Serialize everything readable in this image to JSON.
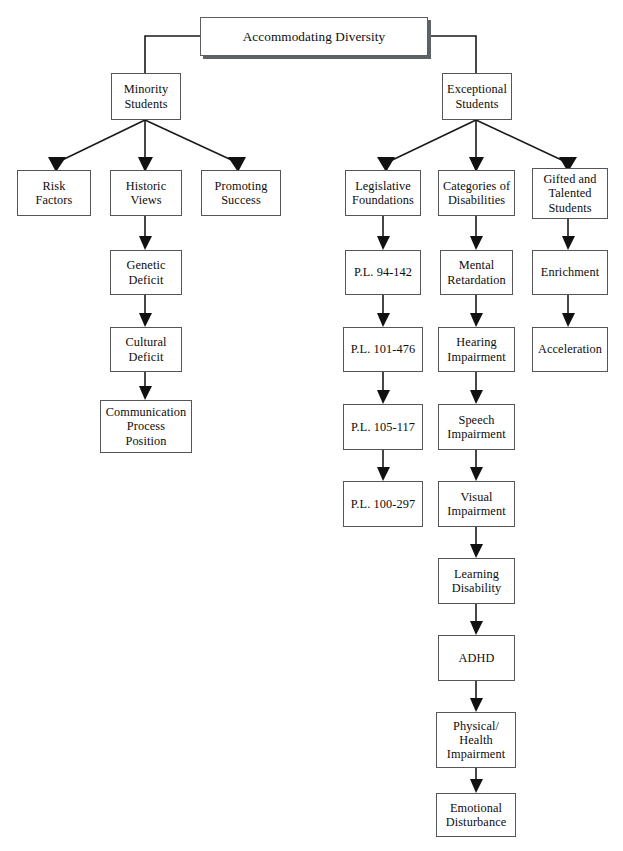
{
  "diagram": {
    "title": "Accommodating Diversity",
    "type": "hierarchical-flowchart",
    "root": "Accommodating Diversity",
    "branches": {
      "minority": {
        "heading": "Minority\nStudents",
        "children": [
          "Risk\nFactors",
          "Historic\nViews",
          "Promoting\nSuccess"
        ],
        "historic_views_chain": [
          "Genetic\nDeficit",
          "Cultural\nDeficit",
          "Communication\nProcess\nPosition"
        ]
      },
      "exceptional": {
        "heading": "Exceptional\nStudents",
        "children": [
          "Legislative\nFoundations",
          "Categories of\nDisabilities",
          "Gifted and\nTalented\nStudents"
        ],
        "legislative_chain": [
          "P.L. 94-142",
          "P.L. 101-476",
          "P.L. 105-117",
          "P.L. 100-297"
        ],
        "disabilities_chain": [
          "Mental\nRetardation",
          "Hearing\nImpairment",
          "Speech\nImpairment",
          "Visual\nImpairment",
          "Learning\nDisability",
          "ADHD",
          "Physical/\nHealth\nImpairment",
          "Emotional\nDisturbance"
        ],
        "gifted_chain": [
          "Enrichment",
          "Acceleration"
        ]
      }
    },
    "colors": {
      "background": "#ffffff",
      "box_border": "#53565a",
      "text": "#0d0d0d",
      "connector": "#1a1a1a",
      "title_shadow": "#5f6266"
    }
  }
}
